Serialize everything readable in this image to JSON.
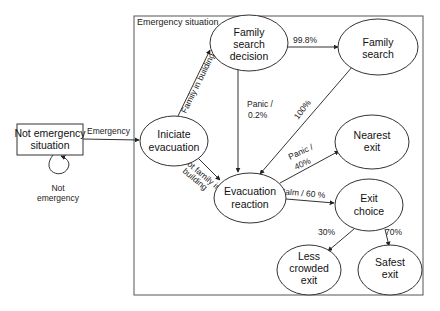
{
  "diagram": {
    "frame": {
      "label": "Emergency situation"
    },
    "nodes": {
      "not_emergency": {
        "line1": "Not emergency",
        "line2": "situation"
      },
      "iniciate": {
        "line1": "Iniciate",
        "line2": "evacuation"
      },
      "family_decision": {
        "line1": "Family",
        "line2": "search",
        "line3": "decision"
      },
      "family_search": {
        "line1": "Family",
        "line2": "search"
      },
      "nearest_exit": {
        "line1": "Nearest",
        "line2": "exit"
      },
      "evac_reaction": {
        "line1": "Evacuation",
        "line2": "reaction"
      },
      "exit_choice": {
        "line1": "Exit",
        "line2": "choice"
      },
      "less_crowded": {
        "line1": "Less",
        "line2": "crowded",
        "line3": "exit"
      },
      "safest_exit": {
        "line1": "Safest",
        "line2": "exit"
      }
    },
    "edges": {
      "self_loop": {
        "line1": "Not",
        "line2": "emergency"
      },
      "emergency": "Emergency",
      "family_in_building": "Family in building",
      "not_family_line1": "Not family in",
      "not_family_line2": "building",
      "to_family_search": "99.8%",
      "panic_decision_line1": "Panic /",
      "panic_decision_line2": "0.2%",
      "hundred": "100%",
      "panic_nearest_line1": "Panic /",
      "panic_nearest_line2": "40%",
      "calm": "Calm / 60 %",
      "to_less_crowded": "30%",
      "to_safest": "70%"
    }
  }
}
